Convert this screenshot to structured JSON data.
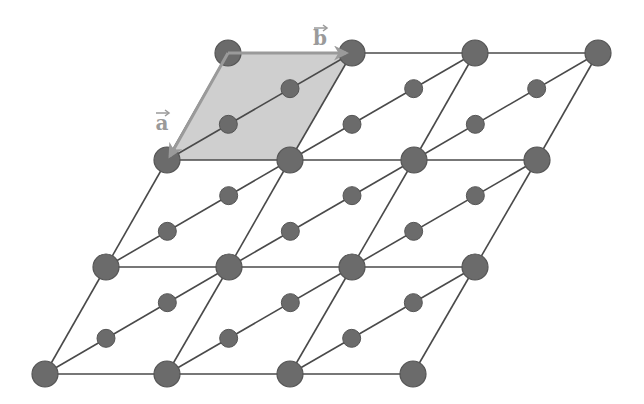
{
  "diagram": {
    "type": "triangular-lattice-unit-cell",
    "colors": {
      "background": "#ffffff",
      "edge": "#4a4a4a",
      "large_atom_fill": "#6b6b6b",
      "large_atom_stroke": "#555555",
      "small_atom_fill": "#6b6b6b",
      "small_atom_stroke": "#555555",
      "unit_cell_fill": "#cfcfcf",
      "vector": "#9a9a9a"
    },
    "lattice": {
      "rows": [
        {
          "y": 53,
          "x": [
            228,
            352,
            475,
            598
          ]
        },
        {
          "y": 160,
          "x": [
            167,
            290,
            414,
            537
          ]
        },
        {
          "y": 267,
          "x": [
            106,
            229,
            352,
            475
          ]
        },
        {
          "y": 374,
          "x": [
            45,
            167,
            290,
            413
          ]
        }
      ],
      "large_radius": 13,
      "small_radius": 9
    },
    "unit_cell": {
      "points": [
        [
          228,
          53
        ],
        [
          352,
          53
        ],
        [
          290,
          160
        ],
        [
          167,
          160
        ]
      ]
    },
    "vectors": [
      {
        "name": "a",
        "label": "a",
        "from": [
          228,
          53
        ],
        "to": [
          170,
          156
        ],
        "label_pos": [
          162,
          130
        ]
      },
      {
        "name": "b",
        "label": "b",
        "from": [
          228,
          53
        ],
        "to": [
          346,
          53
        ],
        "label_pos": [
          320,
          45
        ]
      }
    ]
  }
}
